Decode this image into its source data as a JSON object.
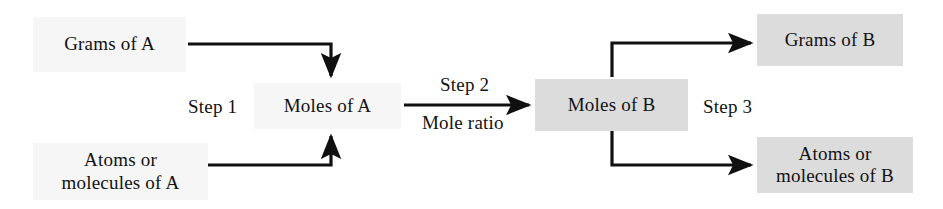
{
  "diagram": {
    "colors": {
      "box_light": "#f6f6f6",
      "box_shaded": "#dcdcdc",
      "line": "#101010",
      "text": "#121212",
      "background": "#ffffff"
    },
    "nodes": {
      "grams_of_a": "Grams of A",
      "atoms_or_molecules_of_a": "Atoms or\nmolecules of A",
      "moles_of_a": "Moles of A",
      "moles_of_b": "Moles of B",
      "grams_of_b": "Grams of B",
      "atoms_or_molecules_of_b": "Atoms or\nmolecules of B"
    },
    "labels": {
      "step1": "Step 1",
      "step2": "Step 2",
      "mole_ratio": "Mole ratio",
      "step3": "Step 3"
    }
  }
}
